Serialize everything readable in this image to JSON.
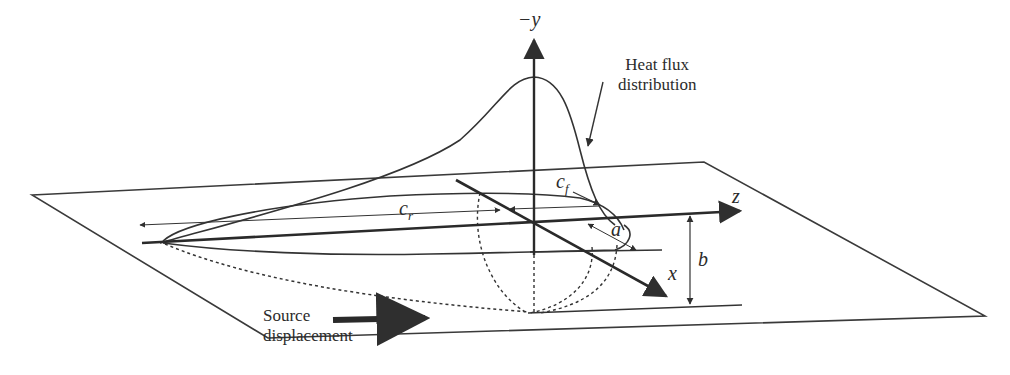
{
  "figure": {
    "type": "3D schematic of moving double-ellipsoid heat source",
    "colors": {
      "line": "#2f2f2f",
      "background": "#ffffff"
    }
  },
  "labels": {
    "axis_y": "−y",
    "axis_z": "z",
    "axis_x": "x",
    "c_r": "c",
    "c_r_sub": "r",
    "c_f": "c",
    "c_f_sub": "f",
    "a": "a",
    "b": "b",
    "heat_flux_line1": "Heat flux",
    "heat_flux_line2": "distribution",
    "source_line1": "Source",
    "source_line2": "displacement"
  }
}
